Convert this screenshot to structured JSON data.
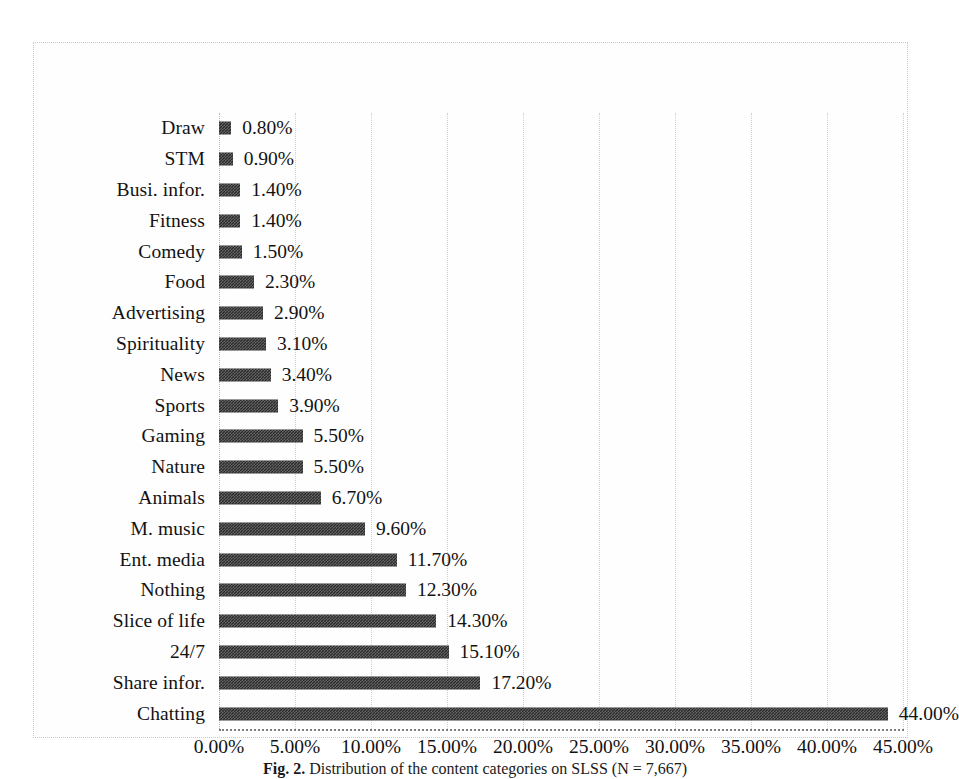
{
  "caption": {
    "label": "Fig. 2.",
    "text": "Distribution of the content categories on SLSS (N = 7,667)"
  },
  "chart_data": {
    "type": "bar",
    "orientation": "horizontal",
    "title": "",
    "xlabel": "",
    "ylabel": "",
    "xlim": [
      0,
      45
    ],
    "xtick_labels": [
      "0.00%",
      "5.00%",
      "10.00%",
      "15.00%",
      "20.00%",
      "25.00%",
      "30.00%",
      "35.00%",
      "40.00%",
      "45.00%"
    ],
    "xtick_values": [
      0,
      5,
      10,
      15,
      20,
      25,
      30,
      35,
      40,
      45
    ],
    "grid": "vertical-dotted",
    "legend": "none",
    "bar_color": "#2b2b2b",
    "categories": [
      "Draw",
      "STM",
      "Busi. infor.",
      "Fitness",
      "Comedy",
      "Food",
      "Advertising",
      "Spirituality",
      "News",
      "Sports",
      "Gaming",
      "Nature",
      "Animals",
      "M. music",
      "Ent. media",
      "Nothing",
      "Slice of life",
      "24/7",
      "Share infor.",
      "Chatting"
    ],
    "values": [
      0.8,
      0.9,
      1.4,
      1.4,
      1.5,
      2.3,
      2.9,
      3.1,
      3.4,
      3.9,
      5.5,
      5.5,
      6.7,
      9.6,
      11.7,
      12.3,
      14.3,
      15.1,
      17.2,
      44.0
    ],
    "data_labels": [
      "0.80%",
      "0.90%",
      "1.40%",
      "1.40%",
      "1.50%",
      "2.30%",
      "2.90%",
      "3.10%",
      "3.40%",
      "3.90%",
      "5.50%",
      "5.50%",
      "6.70%",
      "9.60%",
      "11.70%",
      "12.30%",
      "14.30%",
      "15.10%",
      "17.20%",
      "44.00%"
    ]
  }
}
